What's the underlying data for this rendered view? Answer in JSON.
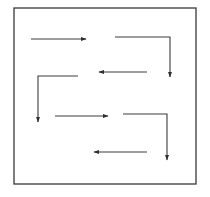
{
  "diagram": {
    "type": "serpentine-scan-path",
    "colors": {
      "background": "#ffffff",
      "frame": "#3a3a3a",
      "arrow": "#3c3c3c"
    },
    "frame": {
      "x": 14,
      "y": 8,
      "width": 182,
      "height": 176
    },
    "arrows": [
      {
        "id": 1,
        "direction": "right",
        "points": [
          [
            31,
            39
          ],
          [
            86,
            39
          ]
        ]
      },
      {
        "id": 2,
        "direction": "right-then-down",
        "points": [
          [
            115,
            37
          ],
          [
            170,
            37
          ],
          [
            170,
            77
          ]
        ]
      },
      {
        "id": 3,
        "direction": "left",
        "points": [
          [
            147,
            72
          ],
          [
            99,
            72
          ]
        ]
      },
      {
        "id": 4,
        "direction": "left-then-down",
        "points": [
          [
            78,
            76
          ],
          [
            38,
            76
          ],
          [
            38,
            122
          ]
        ]
      },
      {
        "id": 5,
        "direction": "right",
        "points": [
          [
            55,
            116
          ],
          [
            108,
            116
          ]
        ]
      },
      {
        "id": 6,
        "direction": "right-then-down",
        "points": [
          [
            123,
            114
          ],
          [
            167,
            114
          ],
          [
            167,
            160
          ]
        ]
      },
      {
        "id": 7,
        "direction": "left",
        "points": [
          [
            147,
            152
          ],
          [
            94,
            152
          ]
        ]
      }
    ]
  }
}
